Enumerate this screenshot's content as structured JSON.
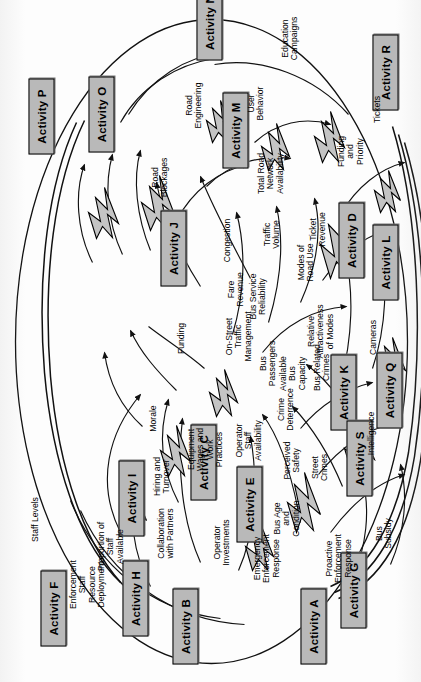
{
  "diagram": {
    "orientation": "rotated-90-ccw",
    "boundary_shape": "oval",
    "colors": {
      "activity_fill": "#b9b9b9",
      "activity_border": "#000000",
      "bolt_fill": "#c4c4c4",
      "line": "#111111",
      "background": "#ffffff"
    }
  },
  "activities": [
    {
      "id": "A",
      "label": "Activity A"
    },
    {
      "id": "B",
      "label": "Activity B"
    },
    {
      "id": "C",
      "label": "Activity C"
    },
    {
      "id": "D",
      "label": "Activity D"
    },
    {
      "id": "E",
      "label": "Activity E"
    },
    {
      "id": "F",
      "label": "Activity F"
    },
    {
      "id": "G",
      "label": "Activity G"
    },
    {
      "id": "H",
      "label": "Activity H"
    },
    {
      "id": "I",
      "label": "Activity I"
    },
    {
      "id": "J",
      "label": "Activity J"
    },
    {
      "id": "K",
      "label": "Activity K"
    },
    {
      "id": "L",
      "label": "Activity L"
    },
    {
      "id": "M",
      "label": "Activity M"
    },
    {
      "id": "N",
      "label": "Activity N"
    },
    {
      "id": "O",
      "label": "Activity O"
    },
    {
      "id": "P",
      "label": "Activity P"
    },
    {
      "id": "Q",
      "label": "Activity Q"
    },
    {
      "id": "R",
      "label": "Activity R"
    },
    {
      "id": "S",
      "label": "Activity S"
    }
  ],
  "variables": [
    {
      "id": "v_enf_staff",
      "label": "Enforcement\nStaff\nResource\nDeployment"
    },
    {
      "id": "v_collab",
      "label": "Collaboration\nwith Partners"
    },
    {
      "id": "v_prop_staff",
      "label": "Proportion of\nStaff\nAvailable"
    },
    {
      "id": "v_staff_levels",
      "label": "Staff Levels"
    },
    {
      "id": "v_hiring",
      "label": "Hiring and\nTurnover"
    },
    {
      "id": "v_morale",
      "label": "Morale"
    },
    {
      "id": "v_equipment",
      "label": "Equipment\nWages and\nWork\nPractices"
    },
    {
      "id": "v_funding",
      "label": "Funding"
    },
    {
      "id": "v_onstreet",
      "label": "On-Street\nTraffic\nManagement"
    },
    {
      "id": "v_op_staff",
      "label": "Operator\nStaff\nAvailability"
    },
    {
      "id": "v_bus_rel",
      "label": "Bus Service\nReliability"
    },
    {
      "id": "v_avail_bus",
      "label": "Available\nBus\nCapacity"
    },
    {
      "id": "v_rel_attract",
      "label": "Relative\nAttractiveness\nof Modes"
    },
    {
      "id": "v_modes",
      "label": "Modes of\nRoad Use"
    },
    {
      "id": "v_traffic_vol",
      "label": "Traffic\nVolume"
    },
    {
      "id": "v_congestion",
      "label": "Congestion"
    },
    {
      "id": "v_total_road",
      "label": "Total Road\nNetwork\nAvailability"
    },
    {
      "id": "v_road_block",
      "label": "Road\nBlockages"
    },
    {
      "id": "v_user_behav",
      "label": "User\nBehavior"
    },
    {
      "id": "v_road_eng",
      "label": "Road\nEngineering"
    },
    {
      "id": "v_edu",
      "label": "Education\nCampaigns"
    },
    {
      "id": "v_perc_safety",
      "label": "Perceived\nSafety"
    },
    {
      "id": "v_bus_age",
      "label": "Bus Age\nand\nCondition"
    },
    {
      "id": "v_op_invest",
      "label": "Operator\nInvestments"
    },
    {
      "id": "v_emerg",
      "label": "Emergency\nEnforcement\nResponse"
    },
    {
      "id": "v_proactive",
      "label": "Proactive\nEnforcement\nResponse"
    },
    {
      "id": "v_bus_subsidy",
      "label": "Bus\nSubsidy"
    },
    {
      "id": "v_street_crimes",
      "label": "Street\nCrimes"
    },
    {
      "id": "v_crime_det",
      "label": "Crime\nDeterrence"
    },
    {
      "id": "v_bus_crimes",
      "label": "Bus Related\nCrimes"
    },
    {
      "id": "v_bus_pass",
      "label": "Bus\nPassengers"
    },
    {
      "id": "v_intel",
      "label": "Intelligence"
    },
    {
      "id": "v_cameras",
      "label": "Cameras"
    },
    {
      "id": "v_fare_rev",
      "label": "Fare\nRevenue"
    },
    {
      "id": "v_ticket_rev",
      "label": "Ticket\nRevenue"
    },
    {
      "id": "v_funding_pri",
      "label": "Funding\nand\nPriority"
    },
    {
      "id": "v_tickets",
      "label": "Tickets"
    }
  ]
}
